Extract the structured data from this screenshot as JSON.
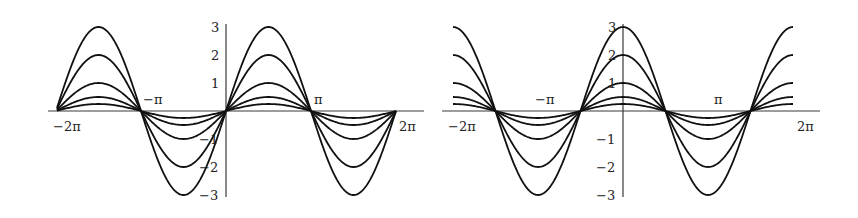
{
  "chart_data": [
    {
      "type": "line",
      "title": "",
      "xlabel": "",
      "ylabel": "",
      "function": "A*sin(x)",
      "xlim": [
        -6.4,
        6.7
      ],
      "ylim": [
        -3,
        3
      ],
      "grid": false,
      "legend": null,
      "x_ticks": [
        "−2π",
        "−π",
        "π",
        "2π"
      ],
      "y_ticks": [
        "3",
        "2",
        "1",
        "−1",
        "−2",
        "−3"
      ],
      "series": [
        {
          "name": "3 sin x",
          "amplitude": 3
        },
        {
          "name": "2 sin x",
          "amplitude": 2
        },
        {
          "name": "sin x",
          "amplitude": 1
        },
        {
          "name": "0.5 sin x",
          "amplitude": 0.5
        },
        {
          "name": "0.25 sin x",
          "amplitude": 0.25
        }
      ]
    },
    {
      "type": "line",
      "title": "",
      "xlabel": "",
      "ylabel": "",
      "function": "A*cos(x)",
      "xlim": [
        -6.4,
        6.7
      ],
      "ylim": [
        -3,
        3
      ],
      "grid": false,
      "legend": null,
      "x_ticks": [
        "−2π",
        "−π",
        "π",
        "2π"
      ],
      "y_ticks": [
        "3",
        "2",
        "1",
        "−1",
        "−2",
        "−3"
      ],
      "series": [
        {
          "name": "3 cos x",
          "amplitude": 3
        },
        {
          "name": "2 cos x",
          "amplitude": 2
        },
        {
          "name": "cos x",
          "amplitude": 1
        },
        {
          "name": "0.5 cos x",
          "amplitude": 0.5
        },
        {
          "name": "0.25 cos x",
          "amplitude": 0.25
        }
      ]
    }
  ],
  "left": {
    "labels": {
      "neg2pi": "−2π",
      "negpi": "−π",
      "pi": "π",
      "pos2pi": "2π",
      "y3": "3",
      "y2": "2",
      "y1": "1",
      "ym1": "−1",
      "ym2": "−2",
      "ym3": "−3"
    }
  },
  "right": {
    "labels": {
      "neg2pi": "−2π",
      "negpi": "−π",
      "pi": "π",
      "pos2pi": "2π",
      "y3": "3",
      "y2": "2",
      "y1": "1",
      "ym1": "−1",
      "ym2": "−2",
      "ym3": "−3"
    }
  }
}
